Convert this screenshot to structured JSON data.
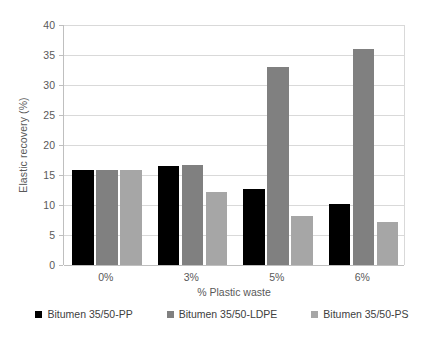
{
  "chart_data": {
    "type": "bar",
    "title": "",
    "xlabel": "% Plastic waste",
    "ylabel": "Elastic recovery (%)",
    "categories": [
      "0%",
      "3%",
      "5%",
      "6%"
    ],
    "series": [
      {
        "name": "Bitumen 35/50-PP",
        "color": "#000000",
        "values": [
          15.8,
          16.5,
          12.7,
          10.2
        ]
      },
      {
        "name": "Bitumen 35/50-LDPE",
        "color": "#808080",
        "values": [
          15.8,
          16.7,
          33.0,
          36.0
        ]
      },
      {
        "name": "Bitumen 35/50-PS",
        "color": "#a6a6a6",
        "values": [
          15.8,
          12.1,
          8.2,
          7.2
        ]
      }
    ],
    "ylim": [
      0,
      40
    ],
    "ytick_step": 5,
    "yticks": [
      "0",
      "5",
      "10",
      "15",
      "20",
      "25",
      "30",
      "35",
      "40"
    ],
    "grid": "horizontal",
    "legend_position": "bottom"
  }
}
